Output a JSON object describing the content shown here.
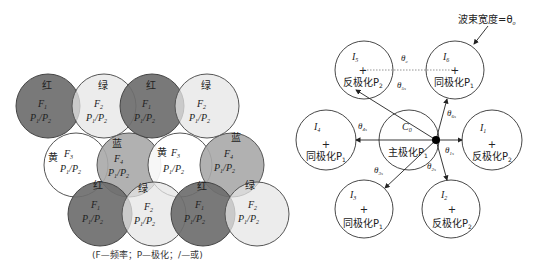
{
  "left_figure": {
    "caption": "(F—频率；P—极化；/—或)",
    "colors": {
      "red": "#6e6e6e",
      "green": "#e6e6e6",
      "yellow": "#ffffff",
      "blue": "#a9a9a9",
      "stroke": "#555555"
    },
    "cells": [
      {
        "color_label": "红",
        "fill": "red",
        "freq": "F",
        "freq_sub": "1",
        "pol": "P",
        "pol_sub1": "1",
        "pol2": "P",
        "pol_sub2": "2",
        "cx": 48,
        "cy": 106
      },
      {
        "color_label": "绿",
        "fill": "green",
        "freq": "F",
        "freq_sub": "2",
        "pol": "P",
        "pol_sub1": "1",
        "pol2": "P",
        "pol_sub2": "2",
        "cx": 104,
        "cy": 106
      },
      {
        "color_label": "红",
        "fill": "red",
        "freq": "F",
        "freq_sub": "1",
        "pol": "P",
        "pol_sub1": "1",
        "pol2": "P",
        "pol_sub2": "2",
        "cx": 152,
        "cy": 106
      },
      {
        "color_label": "绿",
        "fill": "green",
        "freq": "F",
        "freq_sub": "2",
        "pol": "P",
        "pol_sub1": "1",
        "pol2": "P",
        "pol_sub2": "2",
        "cx": 207,
        "cy": 106
      },
      {
        "color_label": "黄",
        "fill": "yellow",
        "freq": "F",
        "freq_sub": "3",
        "pol": "P",
        "pol_sub1": "1",
        "pol2": "P",
        "pol_sub2": "2",
        "cx": 76,
        "cy": 165
      },
      {
        "color_label": "蓝",
        "fill": "blue",
        "freq": "F",
        "freq_sub": "4",
        "pol": "P",
        "pol_sub1": "1",
        "pol2": "P",
        "pol_sub2": "2",
        "cx": 129,
        "cy": 165
      },
      {
        "color_label": "黄",
        "fill": "yellow",
        "freq": "F",
        "freq_sub": "3",
        "pol": "P",
        "pol_sub1": "1",
        "pol2": "P",
        "pol_sub2": "2",
        "cx": 180,
        "cy": 165
      },
      {
        "color_label": "蓝",
        "fill": "blue",
        "freq": "F",
        "freq_sub": "4",
        "pol": "P",
        "pol_sub1": "1",
        "pol2": "P",
        "pol_sub2": "2",
        "cx": 232,
        "cy": 165
      },
      {
        "color_label": "红",
        "fill": "red",
        "freq": "F",
        "freq_sub": "1",
        "pol": "P",
        "pol_sub1": "1",
        "pol2": "P",
        "pol_sub2": "2",
        "cx": 100,
        "cy": 214
      },
      {
        "color_label": "绿",
        "fill": "green",
        "freq": "F",
        "freq_sub": "2",
        "pol": "P",
        "pol_sub1": "1",
        "pol2": "P",
        "pol_sub2": "2",
        "cx": 154,
        "cy": 214
      },
      {
        "color_label": "红",
        "fill": "red",
        "freq": "F",
        "freq_sub": "1",
        "pol": "P",
        "pol_sub1": "1",
        "pol2": "P",
        "pol_sub2": "2",
        "cx": 203,
        "cy": 214
      },
      {
        "color_label": "绿",
        "fill": "green",
        "freq": "F",
        "freq_sub": "2",
        "pol": "P",
        "pol_sub1": "1",
        "pol2": "P",
        "pol_sub2": "2",
        "cx": 257,
        "cy": 214
      }
    ]
  },
  "right_figure": {
    "beamwidth_label": "波束宽度=θ",
    "beamwidth_sub": "o",
    "center_cell": {
      "name": "C",
      "sub": "0",
      "label": "主极化P",
      "label_sub": "1"
    },
    "interferers": [
      {
        "name": "I",
        "sub": "1",
        "label": "反极化P",
        "label_sub": "2",
        "cx": 492,
        "cy": 140
      },
      {
        "name": "I",
        "sub": "2",
        "label": "反极化P",
        "label_sub": "2",
        "cx": 451,
        "cy": 209
      },
      {
        "name": "I",
        "sub": "3",
        "label": "同极化P",
        "label_sub": "1",
        "cx": 364,
        "cy": 209
      },
      {
        "name": "I",
        "sub": "4",
        "label": "同极化P",
        "label_sub": "1",
        "cx": 326,
        "cy": 140
      },
      {
        "name": "I",
        "sub": "5",
        "label": "反极化P",
        "label_sub": "2",
        "cx": 364,
        "cy": 70
      },
      {
        "name": "I",
        "sub": "6",
        "label": "同极化P",
        "label_sub": "1",
        "cx": 455,
        "cy": 70
      }
    ],
    "angles": [
      {
        "sym": "θ",
        "sub": "c"
      },
      {
        "sym": "θ",
        "sub": "1s"
      },
      {
        "sym": "θ",
        "sub": "2s"
      },
      {
        "sym": "θ",
        "sub": "3s"
      },
      {
        "sym": "θ",
        "sub": "4s"
      },
      {
        "sym": "θ",
        "sub": "5s"
      },
      {
        "sym": "θ",
        "sub": "6s"
      }
    ]
  }
}
